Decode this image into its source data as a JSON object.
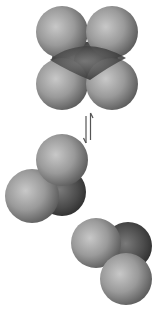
{
  "diagram": {
    "title": "",
    "colors": {
      "background": "#ffffff",
      "light_atom": "#9a9a9a",
      "light_atom_highlight": "#c4c4c4",
      "light_atom_shadow": "#5e5e5e",
      "dark_atom": "#4a4a4a",
      "dark_atom_highlight": "#7a7a7a",
      "dark_atom_shadow": "#262626",
      "arrow": "#555555"
    },
    "arrow": {
      "type": "equilibrium-arrows",
      "symbol": "⇌"
    },
    "molecules": [
      {
        "name": "dimer",
        "atoms": [
          {
            "kind": "dark",
            "cx": 74,
            "cy": 60,
            "r": 22
          },
          {
            "kind": "dark",
            "cx": 96,
            "cy": 62,
            "r": 22
          },
          {
            "kind": "light",
            "cx": 62,
            "cy": 32,
            "r": 26
          },
          {
            "kind": "light",
            "cx": 112,
            "cy": 32,
            "r": 26
          },
          {
            "kind": "light",
            "cx": 62,
            "cy": 84,
            "r": 26
          },
          {
            "kind": "light",
            "cx": 112,
            "cy": 84,
            "r": 26
          }
        ]
      },
      {
        "name": "monomer-left",
        "atoms": [
          {
            "kind": "dark",
            "cx": 62,
            "cy": 192,
            "r": 24
          },
          {
            "kind": "light",
            "cx": 62,
            "cy": 160,
            "r": 26
          },
          {
            "kind": "light",
            "cx": 32,
            "cy": 196,
            "r": 27
          }
        ]
      },
      {
        "name": "monomer-right",
        "atoms": [
          {
            "kind": "dark",
            "cx": 128,
            "cy": 246,
            "r": 24
          },
          {
            "kind": "light",
            "cx": 96,
            "cy": 243,
            "r": 25
          },
          {
            "kind": "light",
            "cx": 126,
            "cy": 279,
            "r": 26
          }
        ]
      }
    ]
  }
}
